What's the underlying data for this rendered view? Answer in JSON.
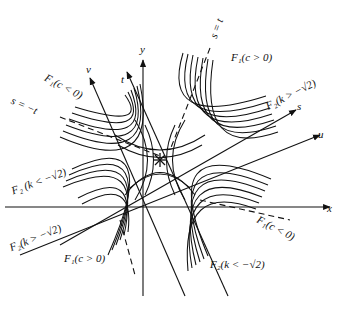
{
  "figure": {
    "type": "level-set diagram",
    "ink_color": "#111111",
    "background": "#ffffff"
  },
  "axes": {
    "x": "x",
    "y": "y",
    "s": "s",
    "t": "t",
    "u": "u",
    "v": "v"
  },
  "annotations": {
    "s_eq_t": "s = t",
    "s_eq_neg_t": "s = −t"
  },
  "curve_labels": {
    "f1_c_pos_top": "F₁(c > 0)",
    "f1_c_neg_left": "F₁(c < 0)",
    "f2_k_gt_right": "F₂(k > −√2)",
    "f2_k_lt_left": "F₂ (k < −√2)",
    "f2_k_gt_left": "F₂(k > −√2)",
    "f1_c_pos_bottom": "F₁(c > 0)",
    "f1_c_neg_right": "F₁(c < 0)",
    "f2_k_lt_bottom": "F₂(k < −√2)"
  },
  "center_marker": "star"
}
